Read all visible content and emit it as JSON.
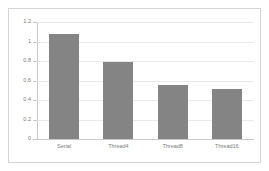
{
  "chart_data": {
    "type": "bar",
    "title": "",
    "subtitle": "",
    "xlabel": "",
    "ylabel": "",
    "categories": [
      "Serial",
      "Thread4",
      "Thread8",
      "Thread16"
    ],
    "values": [
      1.08,
      0.785,
      0.55,
      0.51
    ],
    "series": [
      {
        "name": "",
        "values": [
          1.08,
          0.785,
          0.55,
          0.51
        ]
      }
    ],
    "ylim": [
      0,
      1.2
    ],
    "yticks": [
      0,
      0.2,
      0.4,
      0.6,
      0.8,
      1,
      1.2
    ],
    "ytick_labels": [
      "0",
      "0.2",
      "0.4",
      "0.6",
      "0.8",
      "1",
      "1.2"
    ],
    "grid": true,
    "grid_axis": "y",
    "legend": false,
    "legend_position": "none",
    "colors": {
      "bar": "#848484",
      "gridline": "#e9e9e9",
      "axis": "#c9c9c9",
      "tick_text": "#7a7a7a",
      "frame_border": "#d4d4d4",
      "background": "#ffffff"
    }
  }
}
